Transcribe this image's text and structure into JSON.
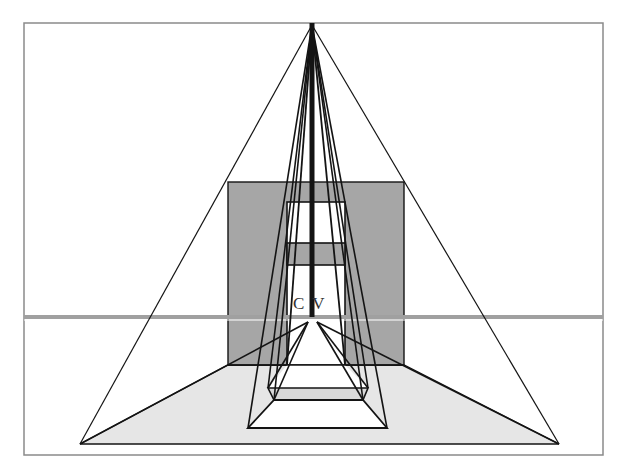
{
  "diagram": {
    "label_cv": "C V",
    "colors": {
      "background": "#ffffff",
      "frame": "#8a8a8a",
      "back_wall": "#a6a6a6",
      "floor": "#e6e6e6",
      "horizon": "#a0a0a0",
      "line": "#141414",
      "inner_band": "#a6a6a6",
      "step_band": "#d9d9d9"
    },
    "frame": {
      "x": 24,
      "y": 23,
      "w": 579,
      "h": 432
    },
    "horizon_y": 317,
    "apex": {
      "x": 312,
      "y": 25
    },
    "vanishing_points": [
      {
        "x": 308,
        "y": 322
      },
      {
        "x": 317,
        "y": 322
      }
    ],
    "back_wall": {
      "x": 228,
      "y": 182,
      "w": 176,
      "h": 183
    },
    "inner_window": {
      "x": 287,
      "y": 202,
      "w": 58,
      "h": 163
    },
    "inner_band": {
      "y1": 243,
      "y2": 265
    },
    "floor": {
      "points": "80,444 559,444 404,365 228,365"
    },
    "inner_floor_triangle": {
      "points": "308,322 317,322 368,388 268,388"
    },
    "step_band": {
      "points": "268,388 368,388 363,400 274,400"
    },
    "bottom_trapezoid": {
      "points": "274,400 363,400 387,428 248,428"
    }
  }
}
